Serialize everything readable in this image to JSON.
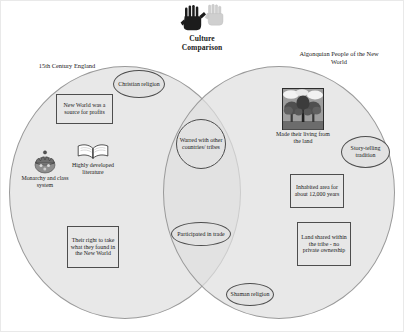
{
  "header": {
    "title_line1": "Culture",
    "title_line2": "Comparison",
    "logo_icon": "handprints-icon"
  },
  "diagram": {
    "type": "venn-two-set",
    "left_set_label": "15th Century England",
    "right_set_label_line1": "Algonquian People of the New",
    "right_set_label_line2": "World",
    "left_only_items": [
      {
        "id": "christian-religion",
        "shape": "ellipse",
        "text": "Christian religion"
      },
      {
        "id": "new-world-profits",
        "shape": "box",
        "text": "New World was a source for profits"
      },
      {
        "id": "monarchy-class-system",
        "shape": "illustration",
        "icon": "crown-icon",
        "text": "Monarchy and class system"
      },
      {
        "id": "highly-developed-literature",
        "shape": "illustration",
        "icon": "open-book-icon",
        "text": "Highly developed literature"
      },
      {
        "id": "their-right-to-take",
        "shape": "box",
        "text": "Their right to take what they found in the New World"
      }
    ],
    "intersection_items": [
      {
        "id": "warred-with-others",
        "shape": "circle",
        "text": "Warred with other countries/ tribes"
      },
      {
        "id": "participated-in-trade",
        "shape": "ellipse",
        "text": "Participated in trade"
      },
      {
        "id": "shaman-religion",
        "shape": "ellipse",
        "text": "Shaman religion"
      }
    ],
    "right_only_items": [
      {
        "id": "made-living-from-land",
        "shape": "illustration",
        "icon": "forest-landscape-icon",
        "text": "Made their living from the land"
      },
      {
        "id": "story-telling-tradition",
        "shape": "ellipse",
        "text": "Story-telling tradition"
      },
      {
        "id": "inhabited-12000-years",
        "shape": "box",
        "text": "Inhabited area for about 12,000 years"
      },
      {
        "id": "land-shared-no-private-ownership",
        "shape": "box",
        "text": "Land shared within the tribe - no private ownership"
      }
    ]
  },
  "style": {
    "circle_fill": "#dfdfdf",
    "circle_stroke": "#9a9a9a",
    "node_fill": "#e4e4e4",
    "node_stroke": "#4d4d4d",
    "text_color": "#1a1a1a",
    "page_background": "#ffffff"
  }
}
